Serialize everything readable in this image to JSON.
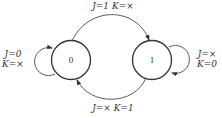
{
  "diagram": {
    "type": "state-diagram",
    "colors": {
      "stroke": "#333333",
      "background": "#ffffff"
    },
    "states": [
      {
        "id": "s0",
        "label": "0"
      },
      {
        "id": "s1",
        "label": "1"
      }
    ],
    "transitions": [
      {
        "from": "0",
        "to": "1",
        "label": "J=1 K=×",
        "j": "1",
        "k": "×"
      },
      {
        "from": "1",
        "to": "0",
        "label": "J=× K=1",
        "j": "×",
        "k": "1"
      },
      {
        "from": "0",
        "to": "0",
        "label_line1": "J=0",
        "label_line2": "K=×",
        "j": "0",
        "k": "×"
      },
      {
        "from": "1",
        "to": "1",
        "label_line1": "J=×",
        "label_line2": "K=0",
        "j": "×",
        "k": "0"
      }
    ]
  }
}
